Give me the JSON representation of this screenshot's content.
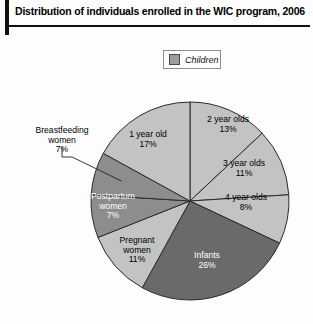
{
  "title": "Distribution of individuals enrolled in the WIC program, 2006",
  "legend": {
    "items": [
      {
        "label": "Children",
        "color": "#9d9d9d",
        "swatch_name": "children-swatch"
      }
    ]
  },
  "colors": {
    "light_gray": "#c3c3c3",
    "mid_gray": "#9d9d9d",
    "dark_gray": "#6a6a6a",
    "outline": "#2b2b2b",
    "rule": "#111111",
    "text_dark": "#000000",
    "text_light": "#ffffff"
  },
  "chart_data": {
    "type": "pie",
    "title": "Distribution of individuals enrolled in the WIC program, 2006",
    "units": "percent",
    "total": 100,
    "start_angle_deg": 0,
    "direction": "clockwise",
    "center": {
      "x": 190,
      "y": 201
    },
    "radius": 99,
    "legend_position": "top-center",
    "categories": [
      "2 year olds",
      "3 year olds",
      "4 year olds",
      "Infants",
      "Pregnant women",
      "Postpartum women",
      "Breastfeeding women",
      "1 year old"
    ],
    "values": [
      13,
      11,
      8,
      26,
      11,
      7,
      7,
      17
    ],
    "slices": [
      {
        "name": "2 year olds",
        "label": "2 year olds",
        "percent": 13,
        "percent_text": "13%",
        "fill": "#c3c3c3",
        "text_color": "#000000",
        "label_x": 228,
        "label_y": 122,
        "label_placement": "inside"
      },
      {
        "name": "3 year olds",
        "label": "3 year olds",
        "percent": 11,
        "percent_text": "11%",
        "fill": "#c3c3c3",
        "text_color": "#000000",
        "label_x": 244,
        "label_y": 166,
        "label_placement": "inside"
      },
      {
        "name": "4 year olds",
        "label": "4 year olds",
        "percent": 8,
        "percent_text": "8%",
        "fill": "#c3c3c3",
        "text_color": "#000000",
        "label_x": 246,
        "label_y": 200,
        "label_placement": "inside"
      },
      {
        "name": "Infants",
        "label": "Infants",
        "percent": 26,
        "percent_text": "26%",
        "fill": "#6a6a6a",
        "text_color": "#ffffff",
        "label_x": 207,
        "label_y": 258,
        "label_placement": "inside"
      },
      {
        "name": "Pregnant women",
        "label": "Pregnant women",
        "percent": 11,
        "percent_text": "11%",
        "fill": "#c3c3c3",
        "text_color": "#000000",
        "label_x": 137,
        "label_y": 243,
        "label_placement": "inside",
        "label_lines": [
          "Pregnant",
          "women"
        ]
      },
      {
        "name": "Postpartum women",
        "label": "Postpartum women",
        "percent": 7,
        "percent_text": "7%",
        "fill": "#8d8d8d",
        "text_color": "#ffffff",
        "label_x": 113,
        "label_y": 199,
        "label_placement": "inside",
        "label_lines": [
          "Postpartum",
          "women"
        ]
      },
      {
        "name": "Breastfeeding women",
        "label": "Breastfeeding women",
        "percent": 7,
        "percent_text": "7%",
        "fill": "#8d8d8d",
        "text_color": "#000000",
        "label_x": 62,
        "label_y": 133,
        "label_placement": "outside",
        "label_lines": [
          "Breastfeeding",
          "women"
        ]
      },
      {
        "name": "1 year old",
        "label": "1 year old",
        "percent": 17,
        "percent_text": "17%",
        "fill": "#c3c3c3",
        "text_color": "#000000",
        "label_x": 148,
        "label_y": 137,
        "label_placement": "inside"
      }
    ]
  }
}
